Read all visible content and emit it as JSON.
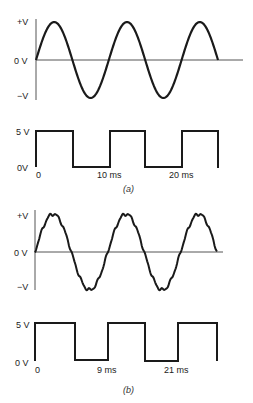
{
  "figure_a": {
    "caption": "(a)",
    "sine": {
      "y_labels": {
        "top": "+V",
        "zero": "0 V",
        "bottom": "−V"
      },
      "cycles": 2.5,
      "noisy": false
    },
    "square": {
      "y_labels": {
        "high": "5 V",
        "low": "0V"
      },
      "x_labels": [
        "0",
        "10 ms",
        "20 ms"
      ]
    }
  },
  "figure_b": {
    "caption": "(b)",
    "sine": {
      "y_labels": {
        "top": "+V",
        "zero": "0 V",
        "bottom": "−V"
      },
      "cycles": 2.5,
      "noisy": true
    },
    "square": {
      "y_labels": {
        "high": "5 V",
        "low": "0 V"
      },
      "x_labels": [
        "0",
        "9 ms",
        "21 ms"
      ]
    }
  },
  "colors": {
    "stroke": "#1a1a1a",
    "axis": "#555555"
  }
}
